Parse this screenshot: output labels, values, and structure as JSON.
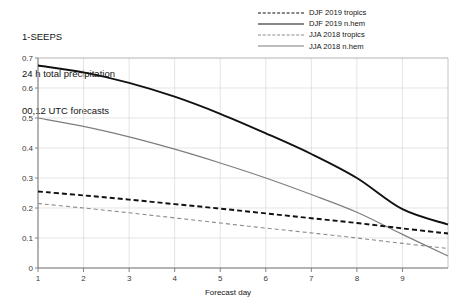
{
  "title": {
    "line1": "1-SEEPS",
    "line2": "24 h total precipitation",
    "line3": "00,12 UTC forecasts"
  },
  "axis": {
    "xlabel": "Forecast day",
    "ylabel": "",
    "xticks": [
      "1",
      "2",
      "3",
      "4",
      "5",
      "6",
      "7",
      "8",
      "9"
    ],
    "yticks": [
      "0",
      "0.1",
      "0.2",
      "0.3",
      "0.4",
      "0.5",
      "0.6",
      "0.7"
    ]
  },
  "legend": [
    {
      "label": "DJF 2019 tropics",
      "style": "sw-dash-black",
      "color": "#111111"
    },
    {
      "label": "DJF 2019 n.hem",
      "style": "sw-solid-black",
      "color": "#111111"
    },
    {
      "label": "JJA 2018 tropics",
      "style": "sw-dash-gray",
      "color": "#8a8a8a"
    },
    {
      "label": "JJA 2018 n.hem",
      "style": "sw-solid-gray",
      "color": "#7d7d7d"
    }
  ],
  "chart_data": {
    "type": "line",
    "title": "1-SEEPS  24 h total precipitation  00,12 UTC forecasts",
    "xlabel": "Forecast day",
    "ylabel": "",
    "xlim": [
      1,
      10
    ],
    "ylim": [
      0,
      0.7
    ],
    "grid": true,
    "legend_position": "top-right",
    "x": [
      1,
      2,
      3,
      4,
      5,
      6,
      7,
      8,
      9,
      10
    ],
    "series": [
      {
        "name": "DJF 2019 n.hem",
        "style": "solid",
        "color": "#111111",
        "width": 1.9,
        "values": [
          0.675,
          0.652,
          0.617,
          0.571,
          0.514,
          0.449,
          0.38,
          0.3,
          0.196,
          0.145
        ]
      },
      {
        "name": "JJA 2018 n.hem",
        "style": "solid",
        "color": "#7d7d7d",
        "width": 1.2,
        "values": [
          0.5,
          0.472,
          0.437,
          0.396,
          0.35,
          0.3,
          0.245,
          0.186,
          0.112,
          0.04
        ]
      },
      {
        "name": "DJF 2019 tropics",
        "style": "dashed",
        "color": "#111111",
        "width": 1.9,
        "values": [
          0.255,
          0.242,
          0.228,
          0.213,
          0.198,
          0.182,
          0.166,
          0.15,
          0.132,
          0.115
        ]
      },
      {
        "name": "JJA 2018 tropics",
        "style": "dashed",
        "color": "#8a8a8a",
        "width": 1.1,
        "values": [
          0.215,
          0.2,
          0.184,
          0.167,
          0.15,
          0.133,
          0.117,
          0.1,
          0.082,
          0.065
        ]
      }
    ]
  }
}
